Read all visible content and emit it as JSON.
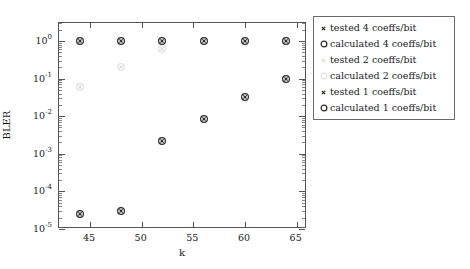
{
  "chart_data": {
    "type": "scatter",
    "title": "",
    "xlabel": "k",
    "ylabel": "BLER",
    "xlim": [
      42,
      66
    ],
    "ylim": [
      1e-05,
      3
    ],
    "yscale": "log",
    "grid": false,
    "legend_position": "right",
    "x": [
      44,
      48,
      52,
      56,
      60,
      64
    ],
    "xticks": [
      "45",
      "50",
      "55",
      "60",
      "65"
    ],
    "xtick_values": [
      45,
      50,
      55,
      60,
      65
    ],
    "ytick_labels": [
      "10",
      "10",
      "10",
      "10",
      "10",
      "10"
    ],
    "ytick_exponents": [
      "0",
      "-1",
      "-2",
      "-3",
      "-4",
      "-5"
    ],
    "ytick_values": [
      1,
      0.1,
      0.01,
      0.001,
      0.0001,
      1e-05
    ],
    "series": [
      {
        "name": "tested 4 coeffs/bit",
        "marker": "cross",
        "color": "#2b2b2b",
        "values": [
          1.0,
          1.0,
          1.0,
          1.0,
          1.0,
          1.0
        ]
      },
      {
        "name": "calculated 4 coeffs/bit",
        "marker": "circle",
        "color": "#2b2b2b",
        "values": [
          1.0,
          1.0,
          1.0,
          1.0,
          1.0,
          1.0
        ]
      },
      {
        "name": "tested 2 coeffs/bit",
        "marker": "cross",
        "color": "#dcdcdc",
        "values": [
          0.06,
          0.2,
          0.6,
          null,
          null,
          null
        ]
      },
      {
        "name": "calculated 2 coeffs/bit",
        "marker": "circle",
        "color": "#e4e4e4",
        "values": [
          0.06,
          0.2,
          0.6,
          null,
          null,
          null
        ]
      },
      {
        "name": "tested 1 coeffs/bit",
        "marker": "cross",
        "color": "#2b2b2b",
        "values": [
          2.5e-05,
          3e-05,
          0.0022,
          0.0085,
          0.033,
          0.1
        ]
      },
      {
        "name": "calculated 1 coeffs/bit",
        "marker": "circle",
        "color": "#2b2b2b",
        "values": [
          2.5e-05,
          3e-05,
          0.0022,
          0.0085,
          0.033,
          0.1
        ]
      }
    ]
  },
  "legend": {
    "items": [
      {
        "label": "tested 4 coeffs/bit",
        "marker": "cross",
        "color": "#2b2b2b"
      },
      {
        "label": "calculated 4 coeffs/bit",
        "marker": "circle",
        "color": "#2b2b2b"
      },
      {
        "label": "tested 2 coeffs/bit",
        "marker": "cross",
        "color": "#dcdcdc"
      },
      {
        "label": "calculated 2 coeffs/bit",
        "marker": "circle",
        "color": "#e4e4e4"
      },
      {
        "label": "tested 1 coeffs/bit",
        "marker": "cross",
        "color": "#2b2b2b"
      },
      {
        "label": "calculated 1 coeffs/bit",
        "marker": "circle",
        "color": "#2b2b2b"
      }
    ]
  },
  "colors": {
    "axis": "#555555",
    "text": "#1a1a1a",
    "dark_series": "#2b2b2b",
    "light_series": "#e0e0e0",
    "background": "#ffffff"
  }
}
